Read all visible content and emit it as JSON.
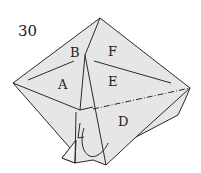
{
  "step_number": "30",
  "labels": {
    "a": "A",
    "b": "B",
    "c_e": "E",
    "d": "D",
    "f": "F"
  },
  "colors": {
    "paper": "#e6e6e6",
    "line": "#2a2a2a",
    "background": "#ffffff"
  }
}
